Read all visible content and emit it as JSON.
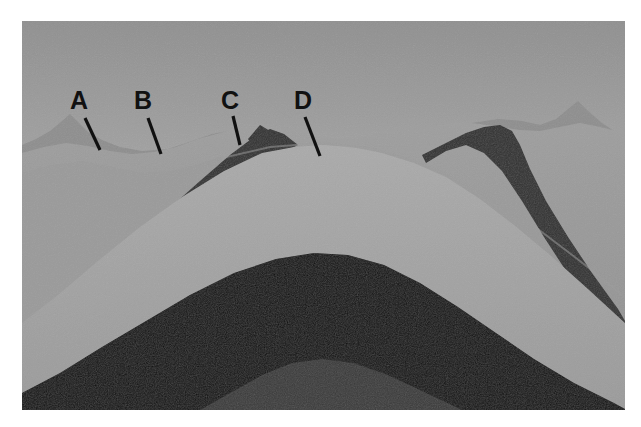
{
  "figure": {
    "kind": "geologic-cross-section",
    "frame": {
      "x": 22,
      "y": 21,
      "width": 603,
      "height": 389
    },
    "palette": {
      "sky_top": "#9a9a9a",
      "sky_bottom": "#c8c8c8",
      "distant_hills": "#8f8f8f",
      "mid_hills": "#8c8c8c",
      "light_stratum": "#9c9c9c",
      "lighter_stratum": "#a6a6a6",
      "pale_stratum": "#b0b0b0",
      "dark_stratum": "#2e2e2e",
      "darkest_stratum": "#111111",
      "core_stratum": "#3b3b3b",
      "label_color": "#111111",
      "border_color": "#ffffff"
    }
  },
  "labels": [
    {
      "id": "A",
      "text": "A",
      "text_x": 70,
      "text_y": 88,
      "leader": {
        "x1": 85,
        "y1": 118,
        "x2": 100,
        "y2": 150
      },
      "points_to": "light-gray upper surface layer on left flank"
    },
    {
      "id": "B",
      "text": "B",
      "text_x": 134,
      "text_y": 88,
      "leader": {
        "x1": 148,
        "y1": 118,
        "x2": 161,
        "y2": 154
      },
      "points_to": "light stratum above the dark band on left limb"
    },
    {
      "id": "C",
      "text": "C",
      "text_x": 221,
      "text_y": 88,
      "leader": {
        "x1": 233,
        "y1": 116,
        "x2": 240,
        "y2": 145
      },
      "points_to": "dark resistant stratum forming the ridge crest"
    },
    {
      "id": "D",
      "text": "D",
      "text_x": 294,
      "text_y": 88,
      "leader": {
        "x1": 305,
        "y1": 117,
        "x2": 320,
        "y2": 156
      },
      "points_to": "light stratum in the eroded core of the fold"
    }
  ],
  "chart_data": {
    "type": "area",
    "xlabel": "",
    "ylabel": "",
    "note": "Stacked geologic strata drawn as nested arch-shaped bands; each band is an area series given as a polygon path in normalized figure coordinates (0-603 wide, 0-389 tall).",
    "series": [
      {
        "name": "sky",
        "color": "#b4b4b4",
        "kind": "background-gradient",
        "values": []
      },
      {
        "name": "distant-ridge-left",
        "color": "#8f8f8f",
        "points": [
          [
            0,
            118
          ],
          [
            20,
            112
          ],
          [
            40,
            100
          ],
          [
            52,
            95
          ],
          [
            62,
            104
          ],
          [
            78,
            116
          ],
          [
            96,
            124
          ],
          [
            120,
            128
          ],
          [
            150,
            126
          ],
          [
            176,
            118
          ],
          [
            196,
            112
          ],
          [
            210,
            110
          ],
          [
            210,
            389
          ],
          [
            0,
            389
          ]
        ]
      },
      {
        "name": "distant-ridge-right",
        "color": "#8f8f8f",
        "points": [
          [
            400,
            112
          ],
          [
            430,
            106
          ],
          [
            460,
            100
          ],
          [
            490,
            96
          ],
          [
            520,
            100
          ],
          [
            545,
            93
          ],
          [
            562,
            86
          ],
          [
            578,
            96
          ],
          [
            592,
            106
          ],
          [
            603,
            112
          ],
          [
            603,
            389
          ],
          [
            400,
            389
          ]
        ]
      },
      {
        "name": "upper-light-surface",
        "color": "#9c9c9c",
        "points": [
          [
            0,
            130
          ],
          [
            40,
            122
          ],
          [
            80,
            128
          ],
          [
            120,
            132
          ],
          [
            160,
            126
          ],
          [
            200,
            114
          ],
          [
            240,
            106
          ],
          [
            280,
            110
          ],
          [
            320,
            114
          ],
          [
            360,
            112
          ],
          [
            400,
            108
          ],
          [
            440,
            102
          ],
          [
            480,
            104
          ],
          [
            520,
            108
          ],
          [
            560,
            104
          ],
          [
            603,
            110
          ],
          [
            603,
            389
          ],
          [
            0,
            389
          ]
        ]
      },
      {
        "name": "dark-band-upper",
        "color": "#2e2e2e",
        "points": [
          [
            60,
            200
          ],
          [
            110,
            164
          ],
          [
            160,
            134
          ],
          [
            210,
            112
          ],
          [
            250,
            106
          ],
          [
            270,
            112
          ],
          [
            250,
            140
          ],
          [
            200,
            164
          ],
          [
            150,
            196
          ],
          [
            100,
            236
          ],
          [
            60,
            272
          ]
        ]
      },
      {
        "name": "light-stratum-core",
        "color": "#a6a6a6",
        "points": [
          [
            0,
            230
          ],
          [
            60,
            200
          ],
          [
            140,
            152
          ],
          [
            230,
            116
          ],
          [
            300,
            112
          ],
          [
            380,
            118
          ],
          [
            460,
            138
          ],
          [
            540,
            172
          ],
          [
            603,
            206
          ],
          [
            603,
            300
          ],
          [
            300,
            200
          ],
          [
            0,
            300
          ]
        ]
      },
      {
        "name": "dark-band-lower",
        "color": "#111111",
        "points": [
          [
            0,
            372
          ],
          [
            80,
            330
          ],
          [
            160,
            286
          ],
          [
            240,
            248
          ],
          [
            300,
            238
          ],
          [
            360,
            250
          ],
          [
            440,
            292
          ],
          [
            520,
            338
          ],
          [
            603,
            380
          ],
          [
            603,
            389
          ],
          [
            0,
            389
          ]
        ]
      },
      {
        "name": "core-stratum",
        "color": "#3b3b3b",
        "points": [
          [
            200,
            389
          ],
          [
            260,
            356
          ],
          [
            300,
            344
          ],
          [
            350,
            352
          ],
          [
            420,
            378
          ],
          [
            460,
            389
          ]
        ]
      }
    ]
  }
}
